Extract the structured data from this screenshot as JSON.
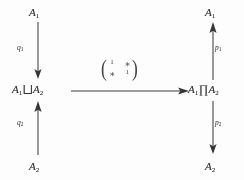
{
  "diagram": {
    "type": "commutative-diagram",
    "ink_color": "#343434",
    "background_color": "#fefefe",
    "objects": {
      "top_left": {
        "base": "A",
        "index": "1",
        "text": "A1"
      },
      "bottom_left": {
        "base": "A",
        "index": "2",
        "text": "A2"
      },
      "top_right": {
        "base": "A",
        "index": "1",
        "text": "A1"
      },
      "bottom_right": {
        "base": "A",
        "index": "2",
        "text": "A2"
      },
      "middle_left": {
        "first_base": "A",
        "first_index": "1",
        "operator": "⨆",
        "second_base": "A",
        "second_index": "2",
        "text": "A1 ⨆ A2",
        "meaning": "coproduct"
      },
      "middle_right": {
        "first_base": "A",
        "first_index": "1",
        "operator": "∏",
        "second_base": "A",
        "second_index": "2",
        "text": "A1 ∏ A2",
        "meaning": "product"
      }
    },
    "arrows": [
      {
        "id": "q1",
        "label_base": "q",
        "label_index": "1",
        "from": "A1 (top left)",
        "to": "A1 ⨆ A2",
        "direction": "down"
      },
      {
        "id": "q2",
        "label_base": "q",
        "label_index": "2",
        "from": "A2 (bottom left)",
        "to": "A1 ⨆ A2",
        "direction": "up"
      },
      {
        "id": "p1",
        "label_base": "p",
        "label_index": "1",
        "from": "A1 ∏ A2",
        "to": "A1 (top right)",
        "direction": "up"
      },
      {
        "id": "p2",
        "label_base": "p",
        "label_index": "2",
        "from": "A1 ∏ A2",
        "to": "A2 (bottom right)",
        "direction": "down"
      },
      {
        "id": "center",
        "from": "A1 ⨆ A2",
        "to": "A1 ∏ A2",
        "direction": "right",
        "label": "matrix"
      }
    ],
    "matrix": {
      "open_paren": "(",
      "close_paren": ")",
      "rows": [
        [
          "1",
          "∗"
        ],
        [
          "∗",
          "1"
        ]
      ],
      "r0c0": "1",
      "r0c1": "∗",
      "r1c0": "∗",
      "r1c1": "1"
    }
  }
}
